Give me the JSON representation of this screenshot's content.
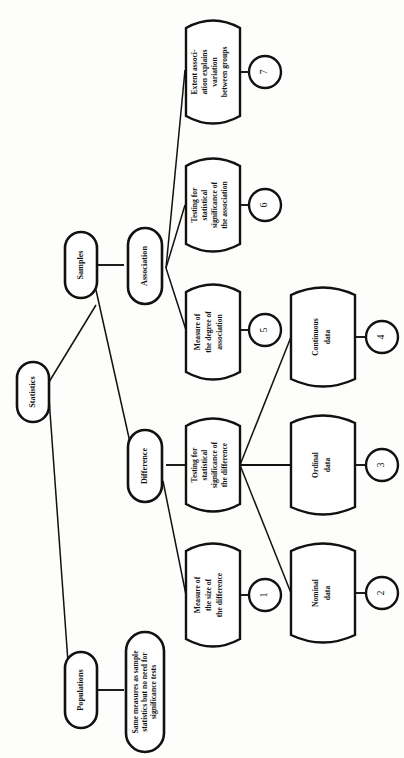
{
  "diagram": {
    "orientation": "rotated-90-ccw",
    "colors": {
      "stroke": "#111111",
      "fill": "#ffffff",
      "background": "#fdfdfc"
    },
    "nodes": [
      {
        "id": "statistics",
        "shape": "stadium",
        "lines": [
          "Statistics"
        ]
      },
      {
        "id": "samples",
        "shape": "stadium",
        "lines": [
          "Samples"
        ]
      },
      {
        "id": "populations",
        "shape": "stadium",
        "lines": [
          "Populations"
        ]
      },
      {
        "id": "association",
        "shape": "stadium",
        "lines": [
          "Association"
        ]
      },
      {
        "id": "difference",
        "shape": "stadium",
        "lines": [
          "Difference"
        ]
      },
      {
        "id": "pop-note",
        "shape": "stadium",
        "lines": [
          "Same measures as sample",
          "statistics but no need for",
          "significance tests"
        ]
      },
      {
        "id": "extent-assoc",
        "shape": "cylinder",
        "lines": [
          "Extent associ-",
          "ation explains",
          "variation",
          "between groups"
        ]
      },
      {
        "id": "test-assoc",
        "shape": "cylinder",
        "lines": [
          "Testing for",
          "statistical",
          "significance of",
          "the association"
        ]
      },
      {
        "id": "degree-assoc",
        "shape": "cylinder",
        "lines": [
          "Measure of",
          "the degree of",
          "association"
        ]
      },
      {
        "id": "test-diff",
        "shape": "cylinder",
        "lines": [
          "Testing for",
          "statistical",
          "significance of",
          "the difference"
        ]
      },
      {
        "id": "size-diff",
        "shape": "cylinder",
        "lines": [
          "Measure of",
          "the size of",
          "the difference"
        ]
      },
      {
        "id": "continuous",
        "shape": "cylinder",
        "lines": [
          "Continuous",
          "data"
        ]
      },
      {
        "id": "ordinal",
        "shape": "cylinder",
        "lines": [
          "Ordinal",
          "data"
        ]
      },
      {
        "id": "nominal",
        "shape": "cylinder",
        "lines": [
          "Nominal",
          "data"
        ]
      }
    ],
    "markers": [
      {
        "id": "marker-1",
        "label": "1",
        "attached_to": "size-diff"
      },
      {
        "id": "marker-2",
        "label": "2",
        "attached_to": "nominal"
      },
      {
        "id": "marker-3",
        "label": "3",
        "attached_to": "ordinal"
      },
      {
        "id": "marker-4",
        "label": "4",
        "attached_to": "continuous"
      },
      {
        "id": "marker-5",
        "label": "5",
        "attached_to": "degree-assoc"
      },
      {
        "id": "marker-6",
        "label": "6",
        "attached_to": "test-assoc"
      },
      {
        "id": "marker-7",
        "label": "7",
        "attached_to": "extent-assoc"
      }
    ],
    "edges": [
      {
        "from": "statistics",
        "to": "samples"
      },
      {
        "from": "statistics",
        "to": "populations"
      },
      {
        "from": "samples",
        "to": "association"
      },
      {
        "from": "samples",
        "to": "difference"
      },
      {
        "from": "populations",
        "to": "pop-note"
      },
      {
        "from": "association",
        "to": "extent-assoc"
      },
      {
        "from": "association",
        "to": "test-assoc"
      },
      {
        "from": "association",
        "to": "degree-assoc"
      },
      {
        "from": "difference",
        "to": "test-diff"
      },
      {
        "from": "difference",
        "to": "size-diff"
      },
      {
        "from": "test-diff",
        "to": "continuous"
      },
      {
        "from": "test-diff",
        "to": "ordinal"
      },
      {
        "from": "test-diff",
        "to": "nominal"
      }
    ]
  }
}
